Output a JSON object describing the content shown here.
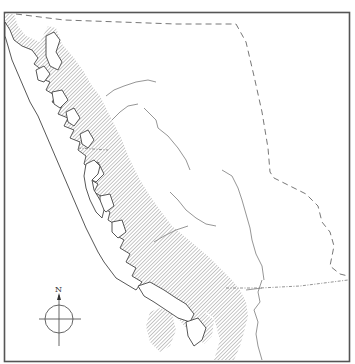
{
  "map": {
    "title": "",
    "compass": {
      "label": "N"
    },
    "colors": {
      "frame": "#555555",
      "hatch": "#9a9a9a",
      "coast": "#444444",
      "border": "#777777",
      "background": "#ffffff"
    },
    "layers": [
      {
        "name": "coastal-hatched-region",
        "style": "diagonal-hatch"
      },
      {
        "name": "coastline-islands",
        "style": "outlined"
      },
      {
        "name": "rivers",
        "style": "thin-line"
      },
      {
        "name": "political-border",
        "style": "dashed"
      },
      {
        "name": "latitude-border",
        "style": "dash-dot"
      }
    ]
  }
}
